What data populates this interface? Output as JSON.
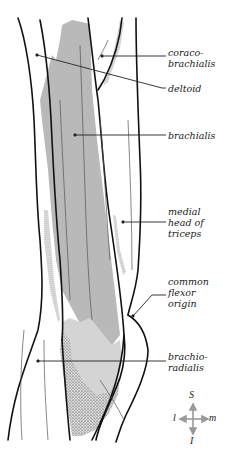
{
  "diagram": {
    "colors": {
      "background": "#ffffff",
      "outline": "#111111",
      "brachialis_fill": "#b9b9b9",
      "lower_fill": "#d2d2d2",
      "stipple": "#333333",
      "leader_line": "#222222",
      "compass": "#9a9a9a"
    },
    "labels": [
      {
        "id": "coracobrachialis",
        "text": "coraco-\nbrachialis"
      },
      {
        "id": "deltoid",
        "text": "deltoid"
      },
      {
        "id": "brachialis",
        "text": "brachialis"
      },
      {
        "id": "medial-head-of-triceps",
        "text": "medial\nhead of\ntriceps"
      },
      {
        "id": "common-flexor-origin",
        "text": "common\nflexor\norigin"
      },
      {
        "id": "brachioradialis",
        "text": "brachio-\nradialis"
      }
    ],
    "compass": {
      "superior": "S",
      "inferior": "I",
      "lateral": "l",
      "medial": "m"
    }
  }
}
